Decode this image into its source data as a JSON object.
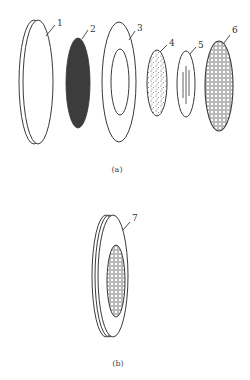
{
  "figure": {
    "part_a": {
      "caption": "(a)",
      "parts": [
        {
          "id": "1",
          "label": "1",
          "shape": "thin-disc-outline"
        },
        {
          "id": "2",
          "label": "2",
          "shape": "solid-dark-ellipse"
        },
        {
          "id": "3",
          "label": "3",
          "shape": "ring"
        },
        {
          "id": "4",
          "label": "4",
          "shape": "speckled-ellipse"
        },
        {
          "id": "5",
          "label": "5",
          "shape": "ellipse-with-slots"
        },
        {
          "id": "6",
          "label": "6",
          "shape": "mesh-ellipse"
        }
      ]
    },
    "part_b": {
      "caption": "(b)",
      "parts": [
        {
          "id": "7",
          "label": "7",
          "shape": "assembled-disc-with-mesh"
        }
      ]
    }
  },
  "colors": {
    "line": "#3a3a3a",
    "fill_dark": "#3c3c3c",
    "background": "#ffffff"
  }
}
